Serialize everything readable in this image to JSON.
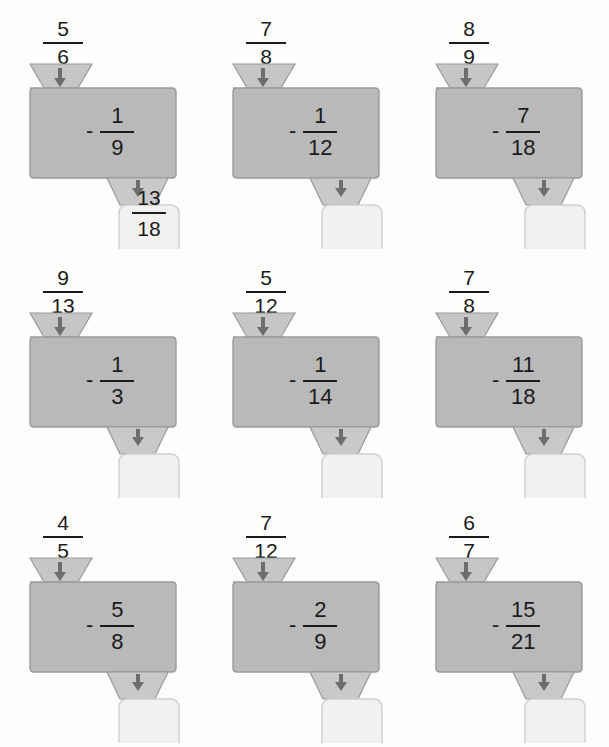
{
  "page": {
    "background_color": "#fdfdfc"
  },
  "style": {
    "machine_body_fill": "#b9b9b9",
    "machine_body_stroke": "#9a9a9a",
    "hopper_fill": "#c6c6c6",
    "funnel_fill": "#c9c9c9",
    "answer_fill": "#f1f1ef",
    "answer_stroke": "#cfcfcd",
    "arrow_color": "#6d6d6d",
    "text_color": "#1b1b1b"
  },
  "icons": {
    "arrow_down": "arrow-down-icon"
  },
  "grid": {
    "rows": 3,
    "columns": 3
  },
  "problems": [
    {
      "id": 1,
      "input": {
        "numerator": "5",
        "denominator": "6"
      },
      "operation": {
        "sign": "-",
        "numerator": "1",
        "denominator": "9"
      },
      "answer": {
        "numerator": "13",
        "denominator": "18",
        "filled": true
      }
    },
    {
      "id": 2,
      "input": {
        "numerator": "7",
        "denominator": "8"
      },
      "operation": {
        "sign": "-",
        "numerator": "1",
        "denominator": "12"
      },
      "answer": {
        "numerator": "",
        "denominator": "",
        "filled": false
      }
    },
    {
      "id": 3,
      "input": {
        "numerator": "8",
        "denominator": "9"
      },
      "operation": {
        "sign": "-",
        "numerator": "7",
        "denominator": "18"
      },
      "answer": {
        "numerator": "",
        "denominator": "",
        "filled": false
      }
    },
    {
      "id": 4,
      "input": {
        "numerator": "9",
        "denominator": "13"
      },
      "operation": {
        "sign": "-",
        "numerator": "1",
        "denominator": "3"
      },
      "answer": {
        "numerator": "",
        "denominator": "",
        "filled": false
      }
    },
    {
      "id": 5,
      "input": {
        "numerator": "5",
        "denominator": "12"
      },
      "operation": {
        "sign": "-",
        "numerator": "1",
        "denominator": "14"
      },
      "answer": {
        "numerator": "",
        "denominator": "",
        "filled": false
      }
    },
    {
      "id": 6,
      "input": {
        "numerator": "7",
        "denominator": "8"
      },
      "operation": {
        "sign": "-",
        "numerator": "11",
        "denominator": "18"
      },
      "answer": {
        "numerator": "",
        "denominator": "",
        "filled": false
      }
    },
    {
      "id": 7,
      "input": {
        "numerator": "4",
        "denominator": "5"
      },
      "operation": {
        "sign": "-",
        "numerator": "5",
        "denominator": "8"
      },
      "answer": {
        "numerator": "",
        "denominator": "",
        "filled": false
      }
    },
    {
      "id": 8,
      "input": {
        "numerator": "7",
        "denominator": "12"
      },
      "operation": {
        "sign": "-",
        "numerator": "2",
        "denominator": "9"
      },
      "answer": {
        "numerator": "",
        "denominator": "",
        "filled": false
      }
    },
    {
      "id": 9,
      "input": {
        "numerator": "6",
        "denominator": "7"
      },
      "operation": {
        "sign": "-",
        "numerator": "15",
        "denominator": "21"
      },
      "answer": {
        "numerator": "",
        "denominator": "",
        "filled": false
      }
    }
  ]
}
